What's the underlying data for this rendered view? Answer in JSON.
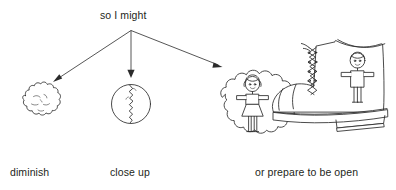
{
  "diagram": {
    "heading": "so I might",
    "style": "hand-drawn line art, black ink on white",
    "ink_color": "#2b2b2b",
    "text_color": "#231f20",
    "background_color": "#ffffff",
    "branches": [
      {
        "id": "diminish",
        "label": "diminish",
        "illustration": "crumpled-ball",
        "illustration_description": "small crumpled paper ball / lumpy blob",
        "arrow": {
          "from": [
            131,
            30
          ],
          "to": [
            53,
            82
          ],
          "direction": "down-left"
        }
      },
      {
        "id": "close-up",
        "label": "close up",
        "illustration": "cracked-circle",
        "illustration_description": "circle split by a jagged vertical crack",
        "arrow": {
          "from": [
            131,
            30
          ],
          "to": [
            131,
            77
          ],
          "direction": "down"
        }
      },
      {
        "id": "prepare-open",
        "label": "or prepare to be open",
        "illustration": "cloud-girl-and-boot-boy",
        "illustration_description": "thought cloud containing a girl figure, next to a laced boot containing a boy figure",
        "arrow": {
          "from": [
            131,
            30
          ],
          "to": [
            222,
            67
          ],
          "direction": "down-right"
        }
      }
    ],
    "arrow_origin": [
      131,
      30
    ],
    "figures": {
      "girl": "stick figure girl with pigtails, dress and arms out",
      "boy": "stick figure boy with short hair and arms out",
      "boot": "tall lace-up boot with thick sole"
    }
  }
}
